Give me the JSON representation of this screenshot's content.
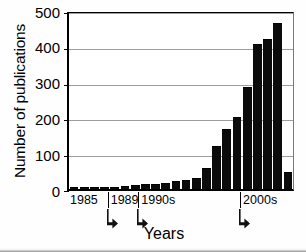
{
  "chart_data": {
    "type": "bar",
    "title": "",
    "xlabel": "Years",
    "ylabel": "Number of publications",
    "ylim": [
      0,
      500
    ],
    "yticks": [
      0,
      100,
      200,
      300,
      400,
      500
    ],
    "ytick_labels": [
      "0",
      "100",
      "200",
      "300",
      "400",
      "500"
    ],
    "grid": true,
    "legend": false,
    "bar_color": "#0b0b0b",
    "categories": [
      "1985",
      "1986",
      "1987",
      "1988",
      "1989",
      "1990",
      "1991",
      "1992",
      "1993",
      "1994",
      "1995",
      "1996",
      "1997",
      "1998",
      "1999",
      "2000",
      "2001",
      "2002",
      "2003",
      "2004",
      "2005",
      "2006"
    ],
    "values": [
      5,
      5,
      5,
      5,
      5,
      8,
      12,
      13,
      15,
      18,
      22,
      25,
      32,
      60,
      122,
      170,
      205,
      290,
      412,
      425,
      473,
      48
    ],
    "x_axis_segments": [
      {
        "label": "1985",
        "start_index": 0,
        "end_index": 3
      },
      {
        "label": "1989",
        "start_index": 4,
        "end_index": 6
      },
      {
        "label": "1990s",
        "start_index": 7,
        "end_index": 16
      },
      {
        "label": "2000s",
        "start_index": 17,
        "end_index": 21
      }
    ],
    "x_axis_markers": [
      "arrow-down-right",
      "arrow-down-right",
      "arrow-down-right"
    ]
  },
  "axes": {
    "y_title": "Number of publications",
    "x_title": "Years"
  },
  "x_segments": [
    {
      "label": "1985"
    },
    {
      "label": "1989"
    },
    {
      "label": "1990s"
    },
    {
      "label": "2000s"
    }
  ]
}
